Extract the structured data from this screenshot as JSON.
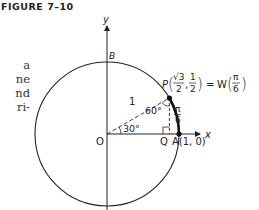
{
  "figure": {
    "title": "FIGURE 7–10"
  },
  "side_text": {
    "lines": [
      "a",
      "ne",
      "nd",
      "ri-"
    ]
  },
  "diagram": {
    "axes": {
      "x_label": "x",
      "y_label": "y"
    },
    "points": {
      "origin": "O",
      "top": "B",
      "foot": "Q",
      "A": "A(1, 0)",
      "P_prefix": "P",
      "P_x_num": "√3",
      "P_x_den": "2",
      "P_y_num": "1",
      "P_y_den": "2",
      "equals": "=",
      "W_prefix": "W",
      "W_num": "π",
      "W_den": "6"
    },
    "labels": {
      "radius": "1",
      "angle_30": "30°",
      "angle_60": "60°",
      "arc_num": "π",
      "arc_den": "6"
    },
    "colors": {
      "stroke": "#222222",
      "background": "#ffffff"
    }
  }
}
